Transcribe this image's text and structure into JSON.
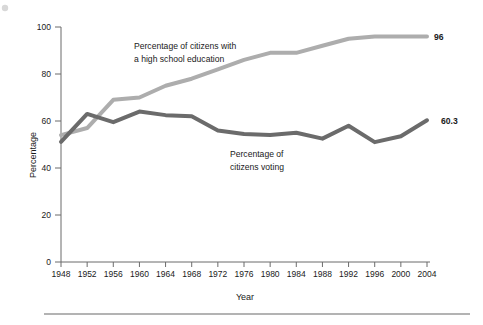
{
  "figure": {
    "background_color": "#ffffff",
    "width": 483,
    "height": 325,
    "footer_rule_color": "#9a9a9a"
  },
  "chart_data": {
    "type": "line",
    "title": "",
    "xlabel": "Year",
    "ylabel": "Percentage",
    "xlim": [
      1948,
      2004
    ],
    "ylim": [
      0,
      100
    ],
    "grid": false,
    "legend_position": "inline-annotations",
    "x": [
      1948,
      1952,
      1956,
      1960,
      1964,
      1968,
      1972,
      1976,
      1980,
      1984,
      1988,
      1992,
      1996,
      2000,
      2004
    ],
    "xticks": [
      "1948",
      "1952",
      "1956",
      "1960",
      "1964",
      "1968",
      "1972",
      "1976",
      "1980",
      "1984",
      "1988",
      "1992",
      "1996",
      "2000",
      "2004"
    ],
    "yticks": [
      "0",
      "20",
      "40",
      "60",
      "80",
      "100"
    ],
    "ytick_values": [
      0,
      20,
      40,
      60,
      80,
      100
    ],
    "series": [
      {
        "name": "Percentage of citizens with a high school education",
        "color": "#adadad",
        "line_width": 4,
        "values": [
          54,
          57,
          69,
          70,
          75,
          78,
          82,
          86,
          89,
          89,
          92,
          95,
          96,
          96,
          96
        ],
        "end_label": "96"
      },
      {
        "name": "Percentage of citizens voting",
        "color": "#6b6b6b",
        "line_width": 4,
        "values": [
          51.1,
          63,
          59.5,
          64,
          62.5,
          62,
          56,
          54.5,
          54,
          55,
          52.5,
          58,
          51,
          53.5,
          60.3
        ],
        "end_label": "60.3"
      }
    ],
    "annotations": [
      {
        "id": "education-annotation",
        "line1": "Percentage of citizens with",
        "line2": "a high school education"
      },
      {
        "id": "voting-annotation",
        "line1": "Percentage of",
        "line2": "citizens voting"
      }
    ]
  }
}
